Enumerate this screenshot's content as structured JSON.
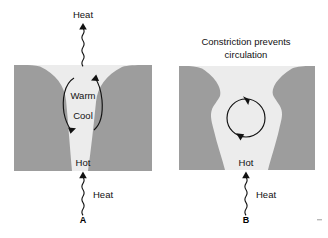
{
  "figure": {
    "name": "convection-constriction-diagram",
    "background_color": "#ffffff",
    "block_color": "#9d9d9d",
    "channel_color": "#ececec",
    "ink_color": "#111111"
  },
  "panels": [
    {
      "id": "A",
      "caption": "A",
      "title": "",
      "labels": {
        "top_heat": "Heat",
        "bottom_heat": "Heat",
        "warm": "Warm",
        "cool": "Cool",
        "hot": "Hot"
      }
    },
    {
      "id": "B",
      "caption": "B",
      "title_line1": "Constriction prevents",
      "title_line2": "circulation",
      "labels": {
        "bottom_heat": "Heat",
        "hot": "Hot"
      }
    }
  ],
  "icons": {
    "heat_arrow": "wavy-arrow-icon",
    "circulation": "circular-arrow-icon"
  }
}
